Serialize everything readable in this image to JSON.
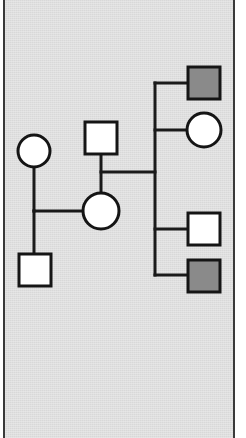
{
  "figure": {
    "kind": "pedigree-chart",
    "title": "Pedigree chart",
    "background_color": "#d8d8d8",
    "page_color": "#ffffff",
    "border_color": "#3a3a3a",
    "line_color": "#1a1a1a",
    "symbol_stroke_color": "#151515",
    "unaffected_fill": "#ffffff",
    "affected_fill": "#8a8a8a"
  },
  "legend": {
    "square_meaning": "male",
    "circle_meaning": "female",
    "open_meaning": "unaffected",
    "filled_meaning": "affected"
  },
  "symbols": [
    {
      "id": "i-1",
      "shape": "circle",
      "sex": "female",
      "status": "unaffected",
      "fill": "#ffffff",
      "cx": 34,
      "cy": 151,
      "r": 16,
      "generation": 1,
      "role": "grandparent-left"
    },
    {
      "id": "i-2",
      "shape": "square",
      "sex": "male",
      "status": "unaffected",
      "fill": "#ffffff",
      "x": 85,
      "y": 122,
      "w": 32,
      "h": 32,
      "generation": 1,
      "role": "grandparent-right"
    },
    {
      "id": "ii-1",
      "shape": "square",
      "sex": "male",
      "status": "unaffected",
      "fill": "#ffffff",
      "x": 19,
      "y": 254,
      "w": 32,
      "h": 32,
      "generation": 2,
      "role": "offspring-left"
    },
    {
      "id": "ii-2",
      "shape": "circle",
      "sex": "female",
      "status": "unaffected",
      "fill": "#ffffff",
      "cx": 101,
      "cy": 211,
      "r": 18,
      "generation": 2,
      "role": "parent-center"
    },
    {
      "id": "iii-1",
      "shape": "square",
      "sex": "male",
      "status": "affected",
      "fill": "#8a8a8a",
      "x": 188,
      "y": 67,
      "w": 32,
      "h": 32,
      "generation": 3,
      "role": "child-1"
    },
    {
      "id": "iii-2",
      "shape": "circle",
      "sex": "female",
      "status": "unaffected",
      "fill": "#ffffff",
      "cx": 204,
      "cy": 130,
      "r": 17,
      "generation": 3,
      "role": "child-2"
    },
    {
      "id": "iii-3",
      "shape": "square",
      "sex": "male",
      "status": "unaffected",
      "fill": "#ffffff",
      "x": 188,
      "y": 213,
      "w": 32,
      "h": 32,
      "generation": 3,
      "role": "child-3"
    },
    {
      "id": "iii-4",
      "shape": "square",
      "sex": "male",
      "status": "affected",
      "fill": "#8a8a8a",
      "x": 188,
      "y": 260,
      "w": 32,
      "h": 32,
      "generation": 3,
      "role": "child-4"
    }
  ],
  "connectors": [
    {
      "id": "drop-i1",
      "kind": "vertical",
      "x1": 34,
      "y1": 167,
      "x2": 34,
      "y2": 211
    },
    {
      "id": "mating-left",
      "kind": "horizontal",
      "x1": 34,
      "y1": 211,
      "x2": 85,
      "y2": 211
    },
    {
      "id": "drop-ii1",
      "kind": "vertical",
      "x1": 34,
      "y1": 211,
      "x2": 34,
      "y2": 254
    },
    {
      "id": "drop-i2",
      "kind": "vertical",
      "x1": 101,
      "y1": 154,
      "x2": 101,
      "y2": 193
    },
    {
      "id": "mating-center",
      "kind": "horizontal",
      "x1": 101,
      "y1": 172,
      "x2": 155,
      "y2": 172
    },
    {
      "id": "sibship-spine",
      "kind": "vertical",
      "x1": 155,
      "y1": 83,
      "x2": 155,
      "y2": 275
    },
    {
      "id": "branch-child-1",
      "kind": "horizontal",
      "x1": 155,
      "y1": 83,
      "x2": 188,
      "y2": 83
    },
    {
      "id": "branch-child-2",
      "kind": "horizontal",
      "x1": 155,
      "y1": 130,
      "x2": 187,
      "y2": 130
    },
    {
      "id": "branch-child-3",
      "kind": "horizontal",
      "x1": 155,
      "y1": 229,
      "x2": 188,
      "y2": 229
    },
    {
      "id": "branch-child-4",
      "kind": "horizontal",
      "x1": 155,
      "y1": 275,
      "x2": 188,
      "y2": 275
    }
  ]
}
